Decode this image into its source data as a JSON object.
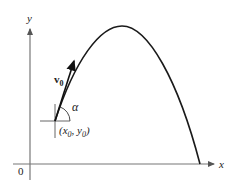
{
  "diagram": {
    "axes": {
      "x_label": "x",
      "y_label": "y",
      "origin_label": "0",
      "axis_color": "#777777"
    },
    "trajectory": {
      "color": "#1a1a1a",
      "start": [
        55,
        121
      ],
      "peak": [
        122,
        26
      ],
      "end": [
        200,
        164
      ]
    },
    "velocity_vector": {
      "label_main": "v",
      "label_sub": "0",
      "color": "#1a1a1a"
    },
    "angle": {
      "label": "α"
    },
    "launch_point": {
      "label_open": "(x",
      "label_sub1": "0",
      "label_mid": ", y",
      "label_sub2": "0",
      "label_close": ")"
    }
  }
}
